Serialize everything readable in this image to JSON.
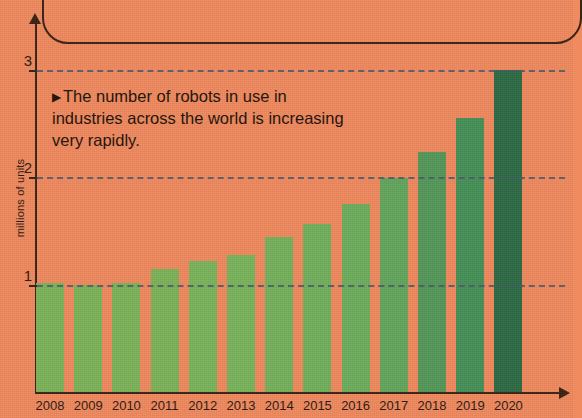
{
  "annotation": {
    "marker": "▶",
    "text": "The number of robots in use in industries across the world is increasing very rapidly."
  },
  "axis": {
    "y_title": "millions of units",
    "y_ticks": [
      "1",
      "2",
      "3"
    ],
    "x_ticks": [
      "2008",
      "2009",
      "2010",
      "2011",
      "2012",
      "2013",
      "2014",
      "2015",
      "2016",
      "2017",
      "2018",
      "2019",
      "2020"
    ]
  },
  "colors": {
    "background": "#f08a5f",
    "axis": "#3b2415",
    "gridline": "#4a5a6b",
    "bar_lightest": "#7cb35a",
    "bar_darkest": "#2f6b46",
    "text": "#231309"
  },
  "chart_data": {
    "type": "bar",
    "title": "",
    "xlabel": "",
    "ylabel": "millions of units",
    "ylim": [
      0,
      3.25
    ],
    "yticks": [
      1,
      2,
      3
    ],
    "grid": true,
    "legend": "none",
    "categories": [
      "2008",
      "2009",
      "2010",
      "2011",
      "2012",
      "2013",
      "2014",
      "2015",
      "2016",
      "2017",
      "2018",
      "2019",
      "2020"
    ],
    "values": [
      1.01,
      1.0,
      1.01,
      1.14,
      1.22,
      1.27,
      1.44,
      1.56,
      1.75,
      1.99,
      2.23,
      2.55,
      3.0
    ],
    "bar_colors": [
      "#7cb35a",
      "#7cb35a",
      "#7cb35a",
      "#7cb35a",
      "#7ab45b",
      "#79b45c",
      "#75b25c",
      "#72b05d",
      "#6eae5d",
      "#64a65d",
      "#55985a",
      "#479058",
      "#2f6b46"
    ],
    "annotation_text": "The number of robots in use in industries across the world is increasing very rapidly."
  }
}
